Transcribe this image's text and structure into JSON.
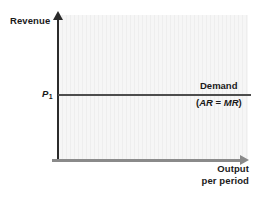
{
  "chart_data": {
    "type": "line",
    "title": "",
    "subtitle": "",
    "xlabel_line1": "Output",
    "xlabel_line2": "per period",
    "ylabel": "Revenue",
    "grid": false,
    "legend_position": "inline-right",
    "axis_ticks": {
      "y": [
        "P1"
      ],
      "x": []
    },
    "annotations": [
      {
        "name": "price-level",
        "text_main": "P",
        "text_sub": "1",
        "axis": "y"
      },
      {
        "name": "demand-curve-label",
        "line1": "Demand",
        "line2_open": "(",
        "line2_ar": "AR",
        "line2_eq": " = ",
        "line2_mr": "MR",
        "line2_close": ")"
      }
    ],
    "series": [
      {
        "name": "Demand (AR = MR)",
        "shape": "horizontal",
        "values": [
          1,
          1
        ],
        "x": [
          0,
          1
        ],
        "color": "#4d4d4d"
      }
    ],
    "colors": {
      "plot_background": "#f3f3f3",
      "y_axis": "#2b2b2b",
      "x_axis": "#8a8a8a",
      "demand_line": "#4d4d4d",
      "text": "#1a1a1a"
    }
  }
}
